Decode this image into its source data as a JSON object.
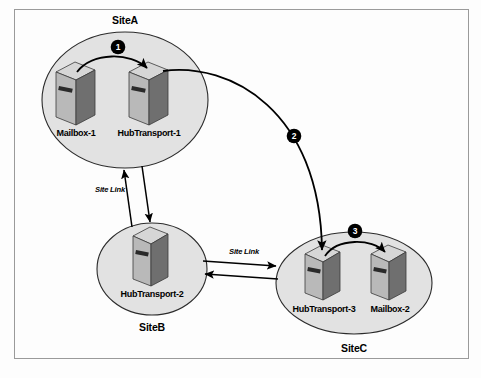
{
  "figure": {
    "background_color": "#fdfdfd",
    "border_color": "#9a9a9a",
    "site_fill_color": "#e2e2e2",
    "site_stroke_color": "#2b2b2b",
    "badge_color": "#000000"
  },
  "sites": [
    {
      "id": "siteA",
      "label": "SiteA",
      "label_position": "top",
      "servers": [
        {
          "id": "mailbox1",
          "label": "Mailbox-1",
          "role": "mailbox"
        },
        {
          "id": "hubtransport1",
          "label": "HubTransport-1",
          "role": "hub-transport"
        }
      ]
    },
    {
      "id": "siteB",
      "label": "SiteB",
      "label_position": "bottom",
      "servers": [
        {
          "id": "hubtransport2",
          "label": "HubTransport-2",
          "role": "hub-transport"
        }
      ]
    },
    {
      "id": "siteC",
      "label": "SiteC",
      "label_position": "bottom",
      "servers": [
        {
          "id": "hubtransport3",
          "label": "HubTransport-3",
          "role": "hub-transport"
        },
        {
          "id": "mailbox2",
          "label": "Mailbox-2",
          "role": "mailbox"
        }
      ]
    }
  ],
  "flow_steps": [
    {
      "number": "1",
      "from": "mailbox1",
      "to": "hubtransport1",
      "scope": "siteA"
    },
    {
      "number": "2",
      "from": "hubtransport1",
      "to": "hubtransport3",
      "scope": "cross-site"
    },
    {
      "number": "3",
      "from": "hubtransport3",
      "to": "mailbox2",
      "scope": "siteC"
    }
  ],
  "site_links": [
    {
      "id": "link-a-b",
      "label": "Site Link",
      "between": [
        "siteA",
        "siteB"
      ],
      "orientation": "vertical",
      "bidirectional": true
    },
    {
      "id": "link-b-c",
      "label": "Site Link",
      "between": [
        "siteB",
        "siteC"
      ],
      "orientation": "horizontal",
      "bidirectional": true
    }
  ]
}
